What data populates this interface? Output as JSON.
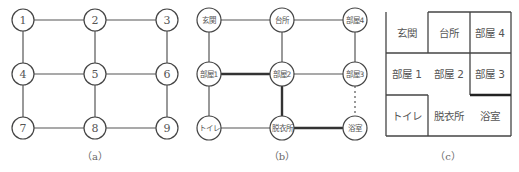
{
  "panels": {
    "a": {
      "caption": "（a）",
      "nodes": [
        "1",
        "2",
        "3",
        "4",
        "5",
        "6",
        "7",
        "8",
        "9"
      ],
      "edges": [
        [
          "1",
          "2"
        ],
        [
          "2",
          "3"
        ],
        [
          "1",
          "4"
        ],
        [
          "2",
          "5"
        ],
        [
          "3",
          "6"
        ],
        [
          "4",
          "5"
        ],
        [
          "5",
          "6"
        ],
        [
          "4",
          "7"
        ],
        [
          "5",
          "8"
        ],
        [
          "6",
          "9"
        ],
        [
          "7",
          "8"
        ],
        [
          "8",
          "9"
        ]
      ]
    },
    "b": {
      "caption": "（b）",
      "nodes": [
        "玄関",
        "台所",
        "部屋4",
        "部屋1",
        "部屋2",
        "部屋3",
        "トイレ",
        "脱衣所",
        "浴室"
      ],
      "edges_normal": [
        [
          "玄関",
          "台所"
        ],
        [
          "台所",
          "部屋4"
        ],
        [
          "玄関",
          "部屋1"
        ],
        [
          "台所",
          "部屋2"
        ],
        [
          "部屋4",
          "部屋3"
        ],
        [
          "部屋2",
          "部屋3"
        ],
        [
          "部屋1",
          "トイレ"
        ],
        [
          "トイレ",
          "脱衣所"
        ]
      ],
      "edges_thick": [
        [
          "部屋1",
          "部屋2"
        ],
        [
          "部屋2",
          "脱衣所"
        ],
        [
          "脱衣所",
          "浴室"
        ]
      ],
      "edges_dotted": [
        [
          "部屋3",
          "浴室"
        ]
      ]
    },
    "c": {
      "caption": "（c）",
      "rooms": [
        "玄関",
        "台所",
        "部屋 4",
        "部屋 1",
        "部屋 2",
        "部屋 3",
        "トイレ",
        "脱衣所",
        "浴室"
      ]
    }
  }
}
